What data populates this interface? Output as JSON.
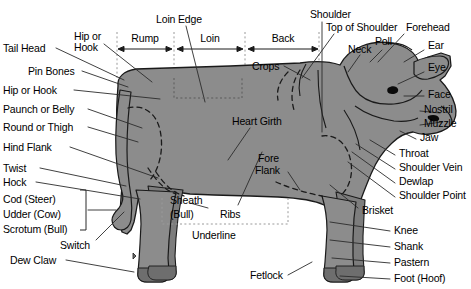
{
  "diagram": {
    "colors": {
      "body_fill": "#8c8c8c",
      "body_fill_dark": "#7a7a7a",
      "outline": "#1a1a1a",
      "leader_line": "#2b2b2b",
      "dotted_guide": "#9a9a9a",
      "text": "#000000",
      "background": "#ffffff"
    },
    "measurements": [
      {
        "id": "rump",
        "label": "Rump",
        "x1": 118,
        "x2": 172,
        "y": 44
      },
      {
        "id": "loin",
        "label": "Loin",
        "x1": 177,
        "x2": 243,
        "y": 44
      },
      {
        "id": "back",
        "label": "Back",
        "x1": 248,
        "x2": 318,
        "y": 44
      }
    ],
    "guide_lines": [
      {
        "id": "rump-start",
        "x": 117,
        "y1": 32,
        "y2": 80
      },
      {
        "id": "rump-loin",
        "x": 174,
        "y1": 32,
        "y2": 98
      },
      {
        "id": "loin-back",
        "x": 245,
        "y1": 32,
        "y2": 80
      },
      {
        "id": "back-end",
        "x": 319,
        "y1": 32,
        "y2": 80
      }
    ],
    "labels_left": [
      {
        "id": "tail-head",
        "text": "Tail Head",
        "x": 3,
        "y": 43
      },
      {
        "id": "pin-bones",
        "text": "Pin Bones",
        "x": 28,
        "y": 66
      },
      {
        "id": "hip-or-hook-left",
        "text": "Hip or Hook",
        "x": 3,
        "y": 85
      },
      {
        "id": "paunch-or-belly",
        "text": "Paunch or Belly",
        "x": 3,
        "y": 104
      },
      {
        "id": "round-or-thigh",
        "text": "Round or Thigh",
        "x": 3,
        "y": 122
      },
      {
        "id": "hind-flank",
        "text": "Hind Flank",
        "x": 3,
        "y": 142
      },
      {
        "id": "twist",
        "text": "Twist",
        "x": 3,
        "y": 163
      },
      {
        "id": "hock",
        "text": "Hock",
        "x": 3,
        "y": 177
      },
      {
        "id": "cod-steer",
        "text": "Cod (Steer)",
        "x": 3,
        "y": 194
      },
      {
        "id": "udder-cow",
        "text": "Udder (Cow)",
        "x": 3,
        "y": 209
      },
      {
        "id": "scrotum-bull",
        "text": "Scrotum (Bull)",
        "x": 3,
        "y": 224
      },
      {
        "id": "switch",
        "text": "Switch",
        "x": 60,
        "y": 240
      },
      {
        "id": "dew-claw",
        "text": "Dew Claw",
        "x": 10,
        "y": 255
      }
    ],
    "labels_top": [
      {
        "id": "hip-or-hook-top",
        "text": "Hip or",
        "x": 74,
        "y": 31
      },
      {
        "id": "hip-or-hook-top2",
        "text": "Hook",
        "x": 74,
        "y": 42
      },
      {
        "id": "loin-edge",
        "text": "Loin Edge",
        "x": 156,
        "y": 14
      },
      {
        "id": "shoulder",
        "text": "Shoulder",
        "x": 310,
        "y": 9
      },
      {
        "id": "top-of-shoulder",
        "text": "Top of Shoulder",
        "x": 326,
        "y": 22
      },
      {
        "id": "forehead",
        "text": "Forehead",
        "x": 406,
        "y": 22
      },
      {
        "id": "neck",
        "text": "Neck",
        "x": 348,
        "y": 44
      },
      {
        "id": "poll",
        "text": "Poll",
        "x": 375,
        "y": 38
      },
      {
        "id": "crops",
        "text": "Crops",
        "x": 252,
        "y": 61
      }
    ],
    "labels_right": [
      {
        "id": "ear",
        "text": "Ear",
        "x": 428,
        "y": 45
      },
      {
        "id": "eye",
        "text": "Eye",
        "x": 428,
        "y": 67
      },
      {
        "id": "face",
        "text": "Face",
        "x": 428,
        "y": 91
      },
      {
        "id": "nostril",
        "text": "Nostril",
        "x": 424,
        "y": 106
      },
      {
        "id": "muzzle",
        "text": "Muzzle",
        "x": 424,
        "y": 120
      },
      {
        "id": "jaw",
        "text": "Jaw",
        "x": 420,
        "y": 134
      },
      {
        "id": "throat",
        "text": "Throat",
        "x": 399,
        "y": 150
      },
      {
        "id": "shoulder-vein",
        "text": "Shoulder Vein",
        "x": 399,
        "y": 164
      },
      {
        "id": "dewlap",
        "text": "Dewlap",
        "x": 399,
        "y": 178
      },
      {
        "id": "shoulder-point",
        "text": "Shoulder Point",
        "x": 399,
        "y": 192
      },
      {
        "id": "brisket",
        "text": "Brisket",
        "x": 362,
        "y": 207
      },
      {
        "id": "knee",
        "text": "Knee",
        "x": 394,
        "y": 227
      },
      {
        "id": "shank",
        "text": "Shank",
        "x": 394,
        "y": 243
      },
      {
        "id": "pastern",
        "text": "Pastern",
        "x": 394,
        "y": 259
      },
      {
        "id": "foot-hoof",
        "text": "Foot (Hoof)",
        "x": 394,
        "y": 275
      }
    ],
    "labels_inner": [
      {
        "id": "heart-girth",
        "text": "Heart Girth",
        "x": 232,
        "y": 118
      },
      {
        "id": "fore-flank-1",
        "text": "Fore",
        "x": 258,
        "y": 155
      },
      {
        "id": "fore-flank-2",
        "text": "Flank",
        "x": 255,
        "y": 167
      },
      {
        "id": "sheath-bull-1",
        "text": "Sheath",
        "x": 170,
        "y": 197
      },
      {
        "id": "sheath-bull-2",
        "text": "(Bull)",
        "x": 170,
        "y": 211
      },
      {
        "id": "ribs",
        "text": "Ribs",
        "x": 220,
        "y": 211
      },
      {
        "id": "underline",
        "text": "Underline",
        "x": 192,
        "y": 232
      },
      {
        "id": "fetlock",
        "text": "Fetlock",
        "x": 250,
        "y": 272
      }
    ],
    "brace": {
      "id": "cod-udder-scrotum-brace",
      "x": 84,
      "y1": 190,
      "y2": 230
    },
    "underline_guide": {
      "x1": 162,
      "x2": 288,
      "y": 224
    },
    "loin_edge_box": {
      "x1": 174,
      "x2": 242,
      "y": 98
    }
  }
}
